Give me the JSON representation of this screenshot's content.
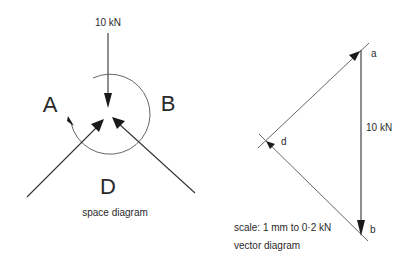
{
  "space_diagram": {
    "caption": "space diagram",
    "load_label": "10 kN",
    "regions": {
      "A": "A",
      "B": "B",
      "D": "D"
    }
  },
  "vector_diagram": {
    "caption": "vector diagram",
    "scale_label": "scale:  1 mm to 0·2 kN",
    "load_label": "10 kN",
    "points": {
      "a": "a",
      "b": "b",
      "d": "d"
    }
  }
}
